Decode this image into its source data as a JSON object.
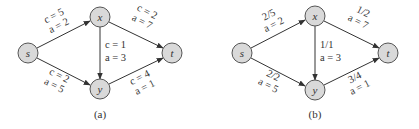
{
  "figures": [
    {
      "caption": "(a)",
      "nodes": [
        {
          "id": "s",
          "label": "s",
          "x": 28,
          "y": 53
        },
        {
          "id": "x",
          "label": "x",
          "x": 100,
          "y": 17
        },
        {
          "id": "y",
          "label": "y",
          "x": 100,
          "y": 89
        },
        {
          "id": "t",
          "label": "t",
          "x": 172,
          "y": 53
        }
      ],
      "edges": [
        {
          "from": "s",
          "to": "x",
          "line1": "c = 5",
          "line2": "a = 2"
        },
        {
          "from": "s",
          "to": "y",
          "line1": "c = 2",
          "line2": "a = 5"
        },
        {
          "from": "x",
          "to": "y",
          "line1": "c = 1",
          "line2": "a = 3"
        },
        {
          "from": "x",
          "to": "t",
          "line1": "c = 2",
          "line2": "a = 7"
        },
        {
          "from": "y",
          "to": "t",
          "line1": "c = 4",
          "line2": "a = 1"
        }
      ]
    },
    {
      "caption": "(b)",
      "nodes": [
        {
          "id": "s",
          "label": "s",
          "x": 242,
          "y": 53
        },
        {
          "id": "x",
          "label": "x",
          "x": 315,
          "y": 16
        },
        {
          "id": "y",
          "label": "y",
          "x": 315,
          "y": 90
        },
        {
          "id": "t",
          "label": "t",
          "x": 388,
          "y": 53
        }
      ],
      "edges": [
        {
          "from": "s",
          "to": "x",
          "line1": "2/5",
          "line2": "a = 2"
        },
        {
          "from": "s",
          "to": "y",
          "line1": "2/2",
          "line2": "a = 5"
        },
        {
          "from": "x",
          "to": "y",
          "line1": "1/1",
          "line2": "a = 3"
        },
        {
          "from": "x",
          "to": "t",
          "line1": "1/2",
          "line2": "a = 7"
        },
        {
          "from": "y",
          "to": "t",
          "line1": "3/4",
          "line2": "a = 1"
        }
      ]
    }
  ]
}
